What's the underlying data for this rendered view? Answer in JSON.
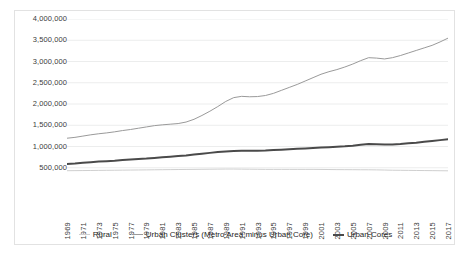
{
  "chart_data": {
    "type": "line",
    "title": "",
    "xlabel": "",
    "ylabel": "",
    "ylim": [
      0,
      4000000
    ],
    "ytick_labels": [
      "4,000,000",
      "3,500,000",
      "3,000,000",
      "2,500,000",
      "2,000,000",
      "1,500,000",
      "1,000,000",
      "500,000"
    ],
    "ytick_values": [
      4000000,
      3500000,
      3000000,
      2500000,
      2000000,
      1500000,
      1000000,
      500000
    ],
    "grid": true,
    "legend_position": "bottom",
    "x": [
      1969,
      1970,
      1971,
      1972,
      1973,
      1974,
      1975,
      1976,
      1977,
      1978,
      1979,
      1980,
      1981,
      1982,
      1983,
      1984,
      1985,
      1986,
      1987,
      1988,
      1989,
      1990,
      1991,
      1992,
      1993,
      1994,
      1995,
      1996,
      1997,
      1998,
      1999,
      2000,
      2001,
      2002,
      2003,
      2004,
      2005,
      2006,
      2007,
      2008,
      2009,
      2010,
      2011,
      2012,
      2013,
      2014,
      2015,
      2016,
      2017
    ],
    "xtick_labels": [
      "1969",
      "1971",
      "1973",
      "1975",
      "1977",
      "1979",
      "1981",
      "1983",
      "1985",
      "1987",
      "1989",
      "1991",
      "1993",
      "1995",
      "1997",
      "1999",
      "2001",
      "2003",
      "2005",
      "2007",
      "2009",
      "2011",
      "2013",
      "2015",
      "2017"
    ],
    "series": [
      {
        "name": "Rural",
        "color": "#cfcfcf",
        "width": 1,
        "values": [
          430000,
          432000,
          434000,
          436000,
          438000,
          440000,
          442000,
          444000,
          446000,
          448000,
          450000,
          452000,
          454000,
          456000,
          458000,
          460000,
          462000,
          464000,
          466000,
          468000,
          470000,
          470000,
          468000,
          466000,
          464000,
          462000,
          462000,
          462000,
          462000,
          462000,
          462000,
          462000,
          460000,
          458000,
          456000,
          455000,
          454000,
          453000,
          452000,
          450000,
          446000,
          442000,
          440000,
          438000,
          436000,
          434000,
          432000,
          430000,
          428000
        ]
      },
      {
        "name": "Urban Clusters (Metro Area minus Urban Core)",
        "color": "#9a9a9a",
        "width": 1,
        "values": [
          1195000,
          1215000,
          1245000,
          1275000,
          1300000,
          1320000,
          1345000,
          1375000,
          1400000,
          1430000,
          1460000,
          1490000,
          1510000,
          1525000,
          1540000,
          1575000,
          1640000,
          1730000,
          1830000,
          1940000,
          2060000,
          2150000,
          2180000,
          2170000,
          2175000,
          2200000,
          2250000,
          2320000,
          2390000,
          2460000,
          2540000,
          2620000,
          2700000,
          2760000,
          2810000,
          2870000,
          2940000,
          3020000,
          3090000,
          3080000,
          3060000,
          3090000,
          3140000,
          3200000,
          3260000,
          3320000,
          3380000,
          3460000,
          3550000
        ]
      },
      {
        "name": "Urban Cores",
        "color": "#4a4a4a",
        "width": 2,
        "values": [
          590000,
          600000,
          615000,
          630000,
          645000,
          655000,
          665000,
          680000,
          695000,
          705000,
          715000,
          730000,
          745000,
          760000,
          775000,
          790000,
          810000,
          830000,
          850000,
          870000,
          885000,
          895000,
          900000,
          898000,
          900000,
          905000,
          915000,
          925000,
          935000,
          945000,
          955000,
          965000,
          975000,
          985000,
          995000,
          1005000,
          1020000,
          1040000,
          1060000,
          1055000,
          1045000,
          1050000,
          1060000,
          1075000,
          1090000,
          1110000,
          1130000,
          1150000,
          1170000
        ]
      }
    ]
  }
}
